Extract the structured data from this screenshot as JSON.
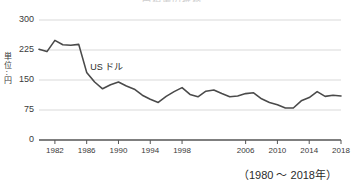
{
  "chart_data": {
    "type": "line",
    "title": "円相場の推移",
    "xlabel": "",
    "ylabel": "単位：円",
    "ylabel_chars": [
      "単",
      "位",
      "：",
      "円"
    ],
    "ylim": [
      0,
      300
    ],
    "yticks": [
      300,
      225,
      150,
      75,
      0
    ],
    "xticks": [
      1982,
      1986,
      1990,
      1994,
      1998,
      2006,
      2010,
      2014,
      2018
    ],
    "xlim": [
      1980,
      2018
    ],
    "grid": true,
    "legend_position": "inline",
    "annotation": "US ドル",
    "range_caption": "（1980 ～ 2018年）",
    "line_color": "#4a4a4a",
    "grid_color": "#d9d9d9",
    "axis_color": "#555555",
    "series": [
      {
        "name": "US ドル",
        "x": [
          1980,
          1981,
          1982,
          1983,
          1984,
          1985,
          1986,
          1987,
          1988,
          1989,
          1990,
          1991,
          1992,
          1993,
          1994,
          1995,
          1996,
          1997,
          1998,
          1999,
          2000,
          2001,
          2002,
          2003,
          2004,
          2005,
          2006,
          2007,
          2008,
          2009,
          2010,
          2011,
          2012,
          2013,
          2014,
          2015,
          2016,
          2017,
          2018
        ],
        "values": [
          227,
          221,
          249,
          238,
          237,
          239,
          169,
          145,
          128,
          138,
          145,
          135,
          127,
          112,
          102,
          94,
          109,
          121,
          131,
          114,
          108,
          122,
          125,
          116,
          108,
          110,
          116,
          118,
          103,
          94,
          88,
          80,
          80,
          98,
          106,
          121,
          109,
          112,
          110
        ]
      }
    ]
  }
}
